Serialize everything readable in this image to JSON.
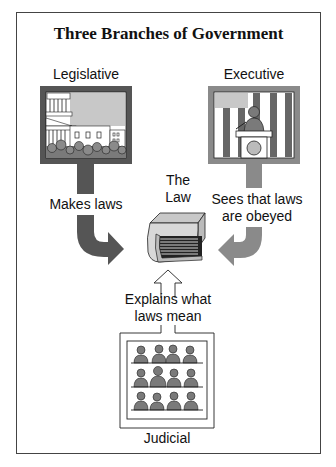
{
  "header": {
    "cut_off_text": "",
    "title": "Three Branches of Government"
  },
  "branches": {
    "legislative": {
      "label": "Legislative",
      "action": "Makes laws",
      "image": "capitol-building-with-crowd",
      "frame_color": "#555555"
    },
    "executive": {
      "label": "Executive",
      "action_line1": "Sees that laws",
      "action_line2": "are obeyed",
      "image": "president-at-podium-with-flag",
      "frame_color": "#8a8a8a"
    },
    "judicial": {
      "label": "Judicial",
      "action_line1": "Explains what",
      "action_line2": "laws mean",
      "image": "panel-of-judges-three-rows"
    }
  },
  "center": {
    "label_line1": "The",
    "label_line2": "Law",
    "image": "book"
  },
  "colors": {
    "dark_gray": "#555555",
    "medium_gray": "#8a8a8a",
    "light_gray": "#c8c8c8",
    "figure_gray": "#777777",
    "stroke": "#222222"
  }
}
